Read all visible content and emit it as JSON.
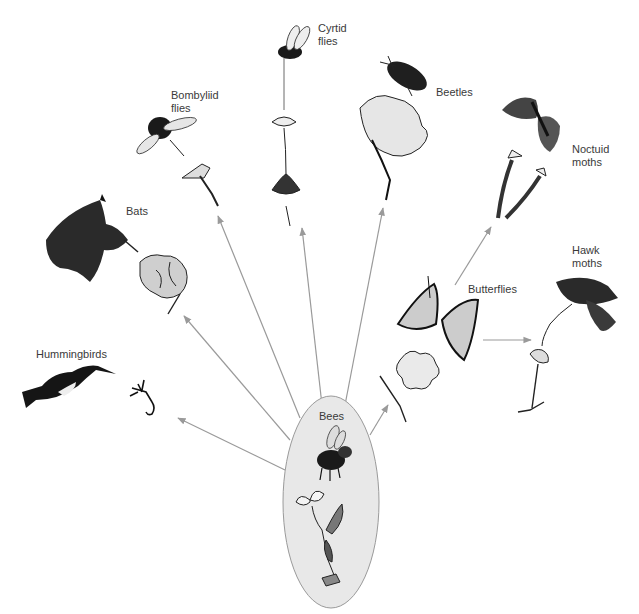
{
  "diagram": {
    "center": {
      "label": "Bees",
      "fill": "#e8e8e8",
      "stroke": "#9a9a9a"
    },
    "arrow_color": "#9a9a9a",
    "pollinators": [
      {
        "id": "hummingbirds",
        "label": "Hummingbirds"
      },
      {
        "id": "bats",
        "label": "Bats"
      },
      {
        "id": "bombyliid-flies",
        "label": "Bombyliid\nflies"
      },
      {
        "id": "cyrtid-flies",
        "label": "Cyrtid\nflies"
      },
      {
        "id": "beetles",
        "label": "Beetles"
      },
      {
        "id": "noctuid-moths",
        "label": "Noctuid\nmoths"
      },
      {
        "id": "butterflies",
        "label": "Butterflies"
      },
      {
        "id": "hawk-moths",
        "label": "Hawk\nmoths"
      }
    ]
  }
}
